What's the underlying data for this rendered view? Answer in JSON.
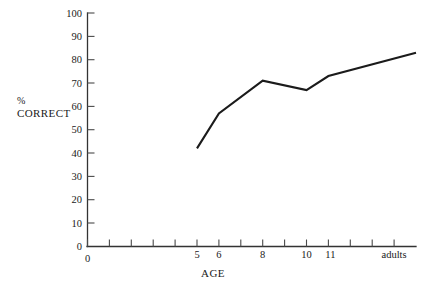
{
  "chart_data": {
    "type": "line",
    "title": "",
    "subtitle": "",
    "xlabel": "AGE",
    "ylabel_line1": "%",
    "ylabel_line2": "CORRECT",
    "categories": [
      "5",
      "6",
      "8",
      "10",
      "11",
      "adults"
    ],
    "values": [
      42,
      57,
      71,
      67,
      73,
      83
    ],
    "series": [
      {
        "name": "% correct",
        "values": [
          42,
          57,
          71,
          67,
          73,
          83
        ]
      }
    ],
    "x_tick_labels": [
      "0",
      "5",
      "6",
      "8",
      "10",
      "11",
      "adults"
    ],
    "x_tick_label_positions": [
      0,
      5,
      6,
      8,
      10,
      11,
      15
    ],
    "x_tick_count": 16,
    "xlim": [
      0,
      15.3
    ],
    "y_tick_labels": [
      "0",
      "10",
      "20",
      "30",
      "40",
      "50",
      "60",
      "70",
      "80",
      "90",
      "100"
    ],
    "y_tick_values": [
      0,
      10,
      20,
      30,
      40,
      50,
      60,
      70,
      80,
      90,
      100
    ],
    "ylim": [
      0,
      100
    ],
    "grid": false,
    "legend": "none",
    "line_color": "#1b1b1b",
    "axis_color": "#333333",
    "background_color": "#ffffff"
  },
  "figure": {
    "caption": ""
  }
}
